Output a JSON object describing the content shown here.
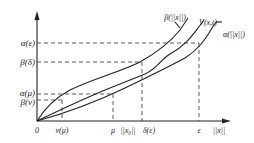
{
  "diagram": {
    "y_labels": {
      "alpha_eps": "α(ε)",
      "beta_delta": "β(δ)",
      "alpha_mu": "α(μ)",
      "beta_nu": "β(ν)"
    },
    "x_labels": {
      "origin": "0",
      "nu_mu": "ν(μ)",
      "mu": "μ",
      "x0": "||x₀||",
      "delta_eps": "δ(ε)",
      "eps": "ε",
      "x_axis": "||x||"
    },
    "curve_labels": {
      "beta": "β(||x||)",
      "V": "V(x,t)",
      "alpha": "α(||x||)"
    },
    "colors": {
      "line": "#222222",
      "background": "#ffffff"
    }
  }
}
